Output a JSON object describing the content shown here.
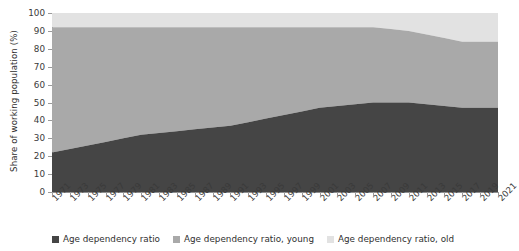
{
  "chart_data": {
    "type": "area",
    "stacked": true,
    "title": "",
    "subtitle": "",
    "xlabel": "",
    "ylabel": "Share of working population (%)",
    "ylim": [
      0,
      100
    ],
    "yticks": [
      0,
      10,
      20,
      30,
      40,
      50,
      60,
      70,
      80,
      90,
      100
    ],
    "grid": false,
    "legend_position": "bottom",
    "x": [
      1971,
      1973,
      1975,
      1977,
      1979,
      1981,
      1983,
      1985,
      1987,
      1989,
      1991,
      1993,
      1995,
      1997,
      1999,
      2001,
      2003,
      2005,
      2007,
      2009,
      2011,
      2013,
      2015,
      2017,
      2019,
      2021
    ],
    "categories": [
      "1971",
      "1973",
      "1975",
      "1977",
      "1979",
      "1981",
      "1983",
      "1985",
      "1987",
      "1989",
      "1991",
      "1993",
      "1995",
      "1997",
      "1999",
      "2001",
      "2003",
      "2005",
      "2007",
      "2009",
      "2011",
      "2013",
      "2015",
      "2017",
      "2019",
      "2021"
    ],
    "series": [
      {
        "name": "Age dependency ratio",
        "color": "#454545",
        "values": [
          22,
          24,
          26,
          28,
          30,
          32,
          33,
          34,
          35,
          36,
          37,
          39,
          41,
          43,
          45,
          47,
          48,
          49,
          50,
          50,
          50,
          49,
          48,
          47,
          47,
          47
        ]
      },
      {
        "name": "Age dependency ratio, young",
        "color": "#a9a9a9",
        "values": [
          70,
          68,
          66,
          64,
          62,
          60,
          59,
          58,
          57,
          56,
          55,
          53,
          51,
          49,
          47,
          45,
          44,
          43,
          42,
          41,
          40,
          39,
          38,
          37,
          37,
          37
        ]
      },
      {
        "name": "Age dependency ratio, old",
        "color": "#e2e2e2",
        "values": [
          8,
          8,
          8,
          8,
          8,
          8,
          8,
          8,
          8,
          8,
          8,
          8,
          8,
          8,
          8,
          8,
          8,
          8,
          8,
          9,
          10,
          12,
          14,
          16,
          16,
          16
        ]
      }
    ],
    "cumulative_top_boundaries": {
      "total": [
        22,
        24,
        26,
        28,
        30,
        32,
        33,
        34,
        35,
        36,
        37,
        39,
        41,
        43,
        45,
        47,
        48,
        49,
        50,
        50,
        50,
        49,
        48,
        47,
        47,
        47
      ],
      "total_plus_young": [
        92,
        92,
        92,
        92,
        92,
        92,
        92,
        92,
        92,
        92,
        92,
        92,
        92,
        92,
        92,
        92,
        92,
        92,
        92,
        91,
        90,
        88,
        86,
        84,
        84,
        84
      ],
      "total_plus_young_plus_old": [
        100,
        100,
        100,
        100,
        100,
        100,
        100,
        100,
        100,
        100,
        100,
        100,
        100,
        100,
        100,
        100,
        100,
        100,
        100,
        100,
        100,
        100,
        100,
        100,
        100,
        100
      ]
    }
  },
  "legend": {
    "items": [
      {
        "label": "Age dependency ratio",
        "color": "#454545"
      },
      {
        "label": "Age dependency ratio, young",
        "color": "#a9a9a9"
      },
      {
        "label": "Age dependency ratio, old",
        "color": "#e2e2e2"
      }
    ]
  },
  "axes": {
    "y_title": "Share of working population (%)"
  }
}
